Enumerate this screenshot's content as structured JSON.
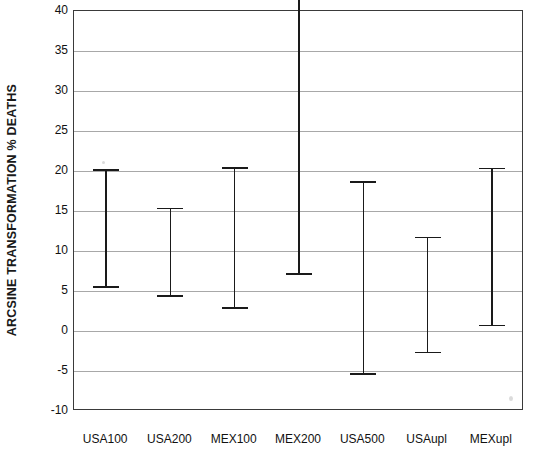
{
  "chart_data": {
    "type": "bar",
    "subtype": "error-bar-range",
    "title": "",
    "xlabel": "",
    "ylabel": "ARCSINE TRANSFORMATION % DEATHS",
    "ylim": [
      -10,
      40
    ],
    "yticks": [
      -10,
      -5,
      0,
      5,
      10,
      15,
      20,
      25,
      30,
      35,
      40
    ],
    "ytick_labels": [
      "-10",
      "-5",
      "0",
      "5",
      "10",
      "15",
      "20",
      "25",
      "30",
      "35",
      "40"
    ],
    "grid": true,
    "legend": "none",
    "categories": [
      "USA100",
      "USA200",
      "MEX100",
      "MEX200",
      "USA500",
      "USAupl",
      "MEXupl"
    ],
    "series": [
      {
        "name": "range",
        "lower": [
          5.5,
          4.4,
          2.9,
          7.1,
          -5.4,
          -2.7,
          0.7
        ],
        "upper": [
          20.1,
          15.3,
          20.4,
          46.2,
          18.6,
          11.7,
          20.3
        ]
      }
    ]
  },
  "axis": {
    "y_title": "ARCSINE TRANSFORMATION % DEATHS"
  },
  "colors": {
    "axis": "#3a3a3a",
    "grid": "#a8a8a8",
    "marker": "#1a1a1a",
    "background": "#ffffff"
  }
}
